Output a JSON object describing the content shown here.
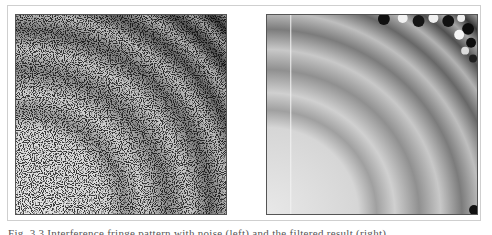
{
  "figure": {
    "panels": [
      {
        "id": "left",
        "description": "interference fringe pattern with salt-and-pepper noise",
        "noise": true
      },
      {
        "id": "right",
        "description": "denoised interference fringe pattern",
        "noise": false
      }
    ],
    "caption": "Fig. 3.3  Interference fringe pattern with noise (left) and the filtered result (right)"
  },
  "colors": {
    "frame_border": "#cfcfcf",
    "panel_border": "#555555",
    "fringe_light": "#e8e8e8",
    "fringe_dark": "#2a2a2a"
  }
}
